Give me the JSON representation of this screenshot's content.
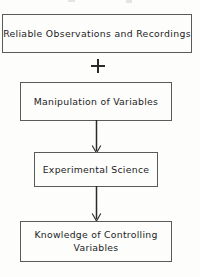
{
  "diagram": {
    "type": "flowchart",
    "orientation": "vertical",
    "background_color": "#fdfdfc",
    "line_color": "#5a5a58",
    "text_color": "#1c1c1c",
    "nodes": [
      {
        "id": "observations",
        "label": "Reliable Observations and Recordings",
        "shape": "rectangle"
      },
      {
        "id": "manipulation",
        "label": "Manipulation of Variables",
        "shape": "rectangle"
      },
      {
        "id": "experimental",
        "label": "Experimental Science",
        "shape": "rectangle"
      },
      {
        "id": "knowledge",
        "label": "Knowledge of Controlling\nVariables",
        "shape": "rectangle"
      }
    ],
    "connectors": [
      {
        "id": "plus",
        "kind": "plus-sign",
        "glyph": "+",
        "from": "observations",
        "to": "manipulation"
      },
      {
        "id": "arrow-1",
        "kind": "arrow-down",
        "from": "manipulation",
        "to": "experimental"
      },
      {
        "id": "arrow-2",
        "kind": "arrow-down",
        "from": "experimental",
        "to": "knowledge"
      }
    ]
  }
}
